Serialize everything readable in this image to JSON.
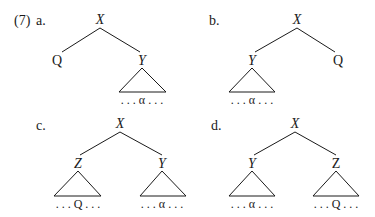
{
  "example_number": "(7)",
  "trees": [
    {
      "id": "a",
      "label": "a.",
      "root": "X",
      "left": "Q",
      "right": "Y",
      "right_yield": ". . . α . . ."
    },
    {
      "id": "b",
      "label": "b.",
      "root": "X",
      "left": "Y",
      "right": "Q",
      "left_yield": ". . . α . . ."
    },
    {
      "id": "c",
      "label": "c.",
      "root": "X",
      "left": "Z",
      "right": "Y",
      "left_yield": ". . . Q . . .",
      "right_yield": ". . . α . . ."
    },
    {
      "id": "d",
      "label": "d.",
      "root": "X",
      "left": "Y",
      "right": "Z",
      "left_yield": ". . . α . . .",
      "right_yield": ". . . Q . . ."
    }
  ]
}
